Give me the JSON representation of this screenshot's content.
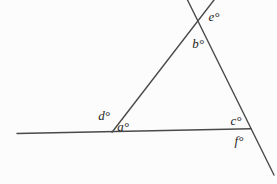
{
  "figure": {
    "labels": {
      "a": "a°",
      "b": "b°",
      "c": "c°",
      "d": "d°",
      "e": "e°",
      "f": "f°"
    },
    "colors": {
      "line": "#4a4a4a",
      "label": "#1f1f1f",
      "background": "#fcfcfc"
    },
    "lines": {
      "base": {
        "x1": "17",
        "y1": "133.5",
        "x2": "251",
        "y2": "128.7"
      },
      "left_side": {
        "x1": "112",
        "y1": "132.3",
        "x2": "214",
        "y2": "0"
      },
      "right_side": {
        "x1": "187.5",
        "y1": "0",
        "x2": "274",
        "y2": "175"
      }
    },
    "stroke_width": "1.4"
  }
}
